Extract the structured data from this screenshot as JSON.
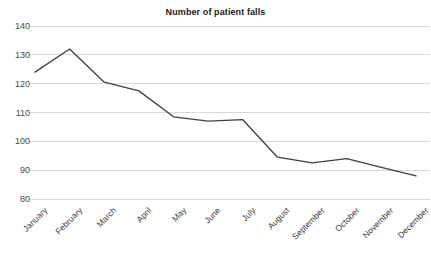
{
  "chart_data": {
    "type": "line",
    "title": "Number of patient falls",
    "xlabel": "",
    "ylabel": "",
    "categories": [
      "January",
      "February",
      "March",
      "April",
      "May",
      "June",
      "July",
      "August",
      "September",
      "October",
      "November",
      "December"
    ],
    "values": [
      124,
      132,
      120.5,
      117.5,
      108.5,
      107,
      107.5,
      94.5,
      92.5,
      94,
      91,
      88
    ],
    "series": [
      {
        "name": "Number of patient falls",
        "values": [
          124,
          132,
          120.5,
          117.5,
          108.5,
          107,
          107.5,
          94.5,
          92.5,
          94,
          91,
          88
        ]
      }
    ],
    "ylim": [
      80,
      140
    ],
    "yticks": [
      80,
      90,
      100,
      110,
      120,
      130,
      140
    ],
    "ytick_labels": [
      "80",
      "90",
      "100",
      "110",
      "120",
      "130",
      "140"
    ],
    "grid": true,
    "grid_axis": "y",
    "legend": false,
    "legend_position": "none",
    "line_color": "#3f3f3f",
    "grid_color": "#d9d9d9",
    "background_color": "#ffffff",
    "text_color": "#3d3d3d",
    "xtick_rotation": -45,
    "markers": false,
    "annotations": []
  },
  "geometry": {
    "plot_left": 35,
    "plot_right": 416,
    "plot_top": 26,
    "plot_bottom": 199
  }
}
